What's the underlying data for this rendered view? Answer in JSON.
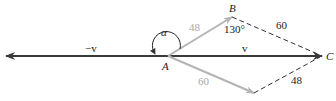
{
  "diagram": {
    "type": "vector-parallelogram",
    "points": {
      "A": {
        "label": "A"
      },
      "B": {
        "label": "B"
      },
      "C": {
        "label": "C"
      }
    },
    "vectors": {
      "v": {
        "label": "v"
      },
      "neg_v": {
        "label": "−v"
      }
    },
    "angles": {
      "alpha": {
        "label": "α"
      },
      "at_B": {
        "label": "130°"
      }
    },
    "lengths": {
      "AB": "48",
      "BC": "60",
      "AD": "60",
      "DC": "48"
    },
    "colors": {
      "main_line": "#3a3a3a",
      "side_vectors": "#b4b4b4",
      "dashed": "#333333"
    }
  }
}
